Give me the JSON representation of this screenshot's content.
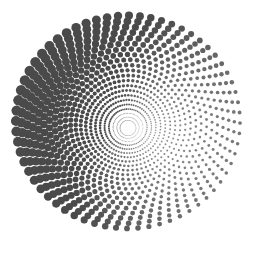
{
  "image": {
    "description": "Halftone spiral vortex of dots",
    "width": 258,
    "height": 254,
    "background": "#ffffff",
    "dot_color": "#4a4a4a"
  },
  "spiral": {
    "center_x": 128,
    "center_y": 128,
    "arms": 64,
    "rings": 22,
    "inner_radius": 8,
    "outer_radius": 112,
    "twist": 2.4,
    "max_dot_radius": 5.2,
    "min_dot_radius": 0.6,
    "heavy_angle_deg": 200
  }
}
